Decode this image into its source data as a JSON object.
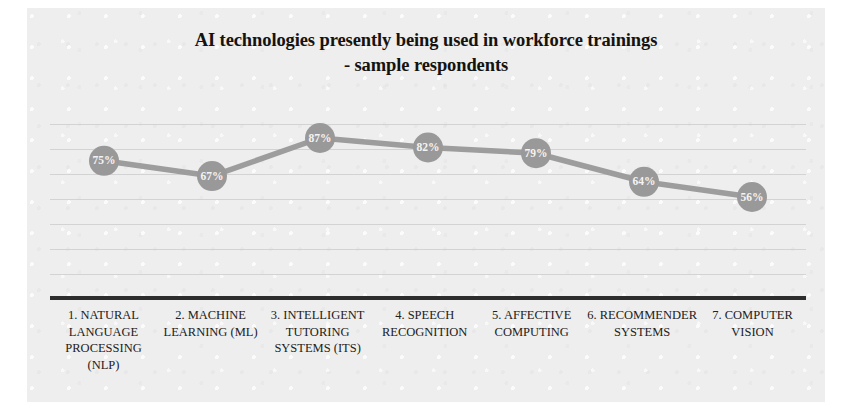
{
  "chart_data": {
    "type": "line",
    "title": "AI technologies presently being used in workforce trainings - sample respondents",
    "title_lines": [
      "AI technologies presently being used in workforce trainings",
      "- sample respondents"
    ],
    "xlabel": "",
    "ylabel": "",
    "ylim": [
      0,
      100
    ],
    "grid": true,
    "gridline_count": 8,
    "legend": "none",
    "marker_color": "#999999",
    "line_color": "#9d9d9d",
    "axis_color": "#2d2d2d",
    "data_label_color": "#f4f4f4",
    "categories": [
      "1. NATURAL LANGUAGE PROCESSING (NLP)",
      "2. MACHINE LEARNING (ML)",
      "3. INTELLIGENT TUTORING SYSTEMS (ITS)",
      "4. SPEECH RECOGNITION",
      "5. AFFECTIVE COMPUTING",
      "6. RECOMMENDER SYSTEMS",
      "7. COMPUTER VISION"
    ],
    "category_lines": [
      [
        "1. NATURAL",
        "LANGUAGE",
        "PROCESSING",
        "(NLP)"
      ],
      [
        "2. MACHINE",
        "LEARNING (ML)"
      ],
      [
        "3. INTELLIGENT",
        "TUTORING",
        "SYSTEMS (ITS)"
      ],
      [
        "4. SPEECH",
        "RECOGNITION"
      ],
      [
        "5. AFFECTIVE",
        "COMPUTING"
      ],
      [
        "6. RECOMMENDER",
        "SYSTEMS"
      ],
      [
        "7. COMPUTER",
        "VISION"
      ]
    ],
    "values": [
      75,
      67,
      87,
      82,
      79,
      64,
      56
    ],
    "data_labels": [
      "75%",
      "67%",
      "87%",
      "82%",
      "79%",
      "64%",
      "56%"
    ]
  }
}
